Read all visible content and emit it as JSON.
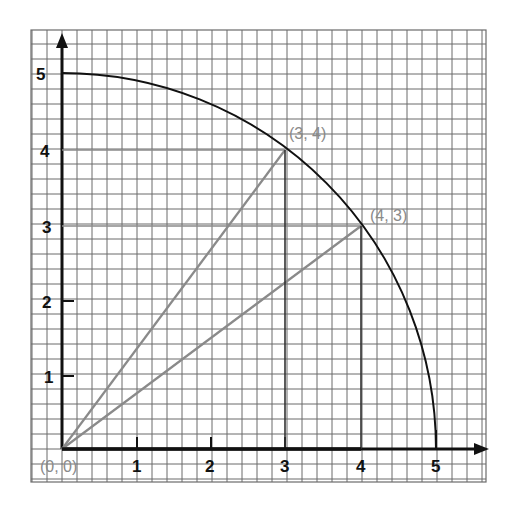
{
  "chart_data": {
    "type": "diagram",
    "title": "",
    "x_ticks": [
      "1",
      "2",
      "3",
      "4",
      "5"
    ],
    "y_ticks": [
      "1",
      "2",
      "3",
      "4",
      "5"
    ],
    "xlim": [
      -0.4,
      5.7
    ],
    "ylim": [
      -0.45,
      5.6
    ],
    "grid": true,
    "minor_divisions_per_unit": 5,
    "curve": {
      "type": "arc",
      "radius": 5,
      "center": [
        0,
        0
      ],
      "from_deg": 0,
      "to_deg": 90
    },
    "points": [
      {
        "label": "(0, 0)",
        "x": 0,
        "y": 0
      },
      {
        "label": "(3, 4)",
        "x": 3,
        "y": 4
      },
      {
        "label": "(4, 3)",
        "x": 4,
        "y": 3
      }
    ],
    "segments": [
      {
        "from": [
          0,
          0
        ],
        "to": [
          3,
          4
        ]
      },
      {
        "from": [
          0,
          0
        ],
        "to": [
          4,
          3
        ]
      },
      {
        "from": [
          0,
          4
        ],
        "to": [
          3,
          4
        ]
      },
      {
        "from": [
          0,
          3
        ],
        "to": [
          4,
          3
        ]
      },
      {
        "from": [
          0,
          0
        ],
        "to": [
          4,
          0
        ]
      }
    ]
  },
  "labels": {
    "origin": "(0, 0)",
    "p34": "(3, 4)",
    "p43": "(4, 3)",
    "x1": "1",
    "x2": "2",
    "x3": "3",
    "x4": "4",
    "x5": "5",
    "y1": "1",
    "y2": "2",
    "y3": "3",
    "y4": "4",
    "y5": "5"
  }
}
